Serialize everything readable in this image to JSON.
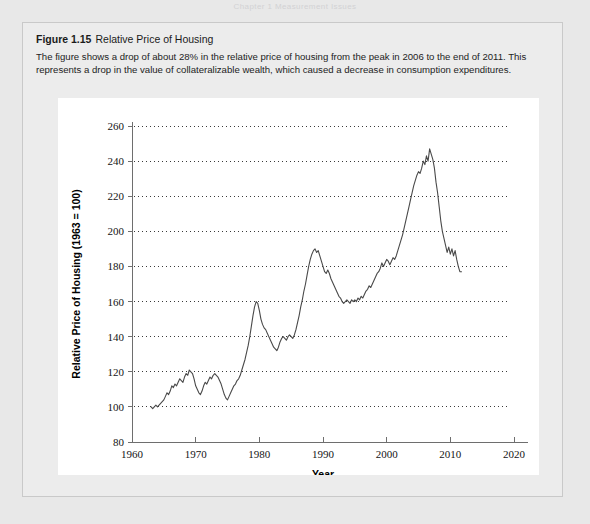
{
  "page": {
    "header_remnant": "Chapter 1   Measurement Issues"
  },
  "figure": {
    "number": "Figure 1.15",
    "title": "Relative Price of Housing",
    "description": "The figure shows a drop of about 28% in the relative price of housing from the peak in 2006 to the end of 2011. This represents a drop in the value of collateralizable wealth, which caused a decrease in consumption expenditures.",
    "colors": {
      "page_background": "#e8e8e8",
      "box_background": "#ececec",
      "box_border": "#c9c9c9",
      "panel_background": "#ffffff",
      "line": "#4a4a4a",
      "gridline": "#3a3a3a",
      "axis": "#6e6e6e"
    }
  },
  "chart_data": {
    "type": "line",
    "title": "",
    "xlabel": "Year",
    "ylabel": "Relative Price of Housing (1963 = 100)",
    "xlim": [
      1960,
      2020
    ],
    "ylim": [
      80,
      260
    ],
    "xticks": [
      1960,
      1970,
      1980,
      1990,
      2000,
      2010,
      2020
    ],
    "yticks": [
      80,
      100,
      120,
      140,
      160,
      180,
      200,
      220,
      240,
      260
    ],
    "grid": "horizontal-dotted",
    "legend": "none",
    "series": [
      {
        "name": "Relative Price of Housing",
        "x": [
          1963.0,
          1963.25,
          1963.5,
          1963.75,
          1964.0,
          1964.25,
          1964.5,
          1964.75,
          1965.0,
          1965.25,
          1965.5,
          1965.75,
          1966.0,
          1966.25,
          1966.5,
          1966.75,
          1967.0,
          1967.25,
          1967.5,
          1967.75,
          1968.0,
          1968.25,
          1968.5,
          1968.75,
          1969.0,
          1969.25,
          1969.5,
          1969.75,
          1970.0,
          1970.25,
          1970.5,
          1970.75,
          1971.0,
          1971.25,
          1971.5,
          1971.75,
          1972.0,
          1972.25,
          1972.5,
          1972.75,
          1973.0,
          1973.25,
          1973.5,
          1973.75,
          1974.0,
          1974.25,
          1974.5,
          1974.75,
          1975.0,
          1975.25,
          1975.5,
          1975.75,
          1976.0,
          1976.25,
          1976.5,
          1976.75,
          1977.0,
          1977.25,
          1977.5,
          1977.75,
          1978.0,
          1978.25,
          1978.5,
          1978.75,
          1979.0,
          1979.25,
          1979.5,
          1979.75,
          1980.0,
          1980.25,
          1980.5,
          1980.75,
          1981.0,
          1981.25,
          1981.5,
          1981.75,
          1982.0,
          1982.25,
          1982.5,
          1982.75,
          1983.0,
          1983.25,
          1983.5,
          1983.75,
          1984.0,
          1984.25,
          1984.5,
          1984.75,
          1985.0,
          1985.25,
          1985.5,
          1985.75,
          1986.0,
          1986.25,
          1986.5,
          1986.75,
          1987.0,
          1987.25,
          1987.5,
          1987.75,
          1988.0,
          1988.25,
          1988.5,
          1988.75,
          1989.0,
          1989.25,
          1989.5,
          1989.75,
          1990.0,
          1990.25,
          1990.5,
          1990.75,
          1991.0,
          1991.25,
          1991.5,
          1991.75,
          1992.0,
          1992.25,
          1992.5,
          1992.75,
          1993.0,
          1993.25,
          1993.5,
          1993.75,
          1994.0,
          1994.25,
          1994.5,
          1994.75,
          1995.0,
          1995.25,
          1995.5,
          1995.75,
          1996.0,
          1996.25,
          1996.5,
          1996.75,
          1997.0,
          1997.25,
          1997.5,
          1997.75,
          1998.0,
          1998.25,
          1998.5,
          1998.75,
          1999.0,
          1999.25,
          1999.5,
          1999.75,
          2000.0,
          2000.25,
          2000.5,
          2000.75,
          2001.0,
          2001.25,
          2001.5,
          2001.75,
          2002.0,
          2002.25,
          2002.5,
          2002.75,
          2003.0,
          2003.25,
          2003.5,
          2003.75,
          2004.0,
          2004.25,
          2004.5,
          2004.75,
          2005.0,
          2005.25,
          2005.5,
          2005.75,
          2006.0,
          2006.25,
          2006.5,
          2006.75,
          2007.0,
          2007.25,
          2007.5,
          2007.75,
          2008.0,
          2008.25,
          2008.5,
          2008.75,
          2009.0,
          2009.25,
          2009.5,
          2009.75,
          2010.0,
          2010.25,
          2010.5,
          2010.75,
          2011.0,
          2011.25,
          2011.5,
          2011.75
        ],
        "y": [
          100,
          99,
          100,
          101,
          100,
          101,
          102,
          103,
          104,
          106,
          108,
          107,
          109,
          112,
          111,
          113,
          112,
          114,
          116,
          115,
          114,
          117,
          119,
          118,
          121,
          120,
          119,
          116,
          112,
          110,
          108,
          107,
          109,
          112,
          114,
          113,
          115,
          117,
          116,
          118,
          119,
          118,
          117,
          115,
          113,
          110,
          107,
          105,
          104,
          106,
          108,
          110,
          112,
          113,
          115,
          116,
          118,
          121,
          124,
          127,
          131,
          135,
          140,
          146,
          152,
          157,
          160,
          159,
          155,
          150,
          147,
          145,
          144,
          142,
          140,
          138,
          136,
          134,
          133,
          132,
          134,
          137,
          139,
          140,
          139,
          138,
          140,
          141,
          140,
          139,
          141,
          144,
          148,
          152,
          157,
          161,
          166,
          170,
          175,
          180,
          184,
          187,
          189,
          190,
          188,
          189,
          186,
          183,
          180,
          177,
          176,
          178,
          176,
          173,
          171,
          169,
          167,
          165,
          163,
          162,
          160,
          159,
          160,
          161,
          160,
          159,
          161,
          160,
          161,
          160,
          162,
          161,
          163,
          162,
          164,
          166,
          167,
          169,
          168,
          170,
          172,
          174,
          176,
          177,
          179,
          182,
          180,
          182,
          184,
          183,
          181,
          183,
          185,
          184,
          186,
          189,
          192,
          195,
          198,
          202,
          206,
          210,
          214,
          218,
          222,
          226,
          229,
          232,
          234,
          233,
          236,
          240,
          238,
          243,
          240,
          247,
          244,
          241,
          236,
          228,
          222,
          214,
          206,
          200,
          196,
          192,
          188,
          191,
          187,
          190,
          186,
          189,
          184,
          180,
          177,
          177
        ]
      }
    ],
    "annotations": {
      "peak_year": 2006,
      "peak_value": 247,
      "end_year": 2011,
      "end_value": 177,
      "drop_percent": "28%"
    }
  }
}
